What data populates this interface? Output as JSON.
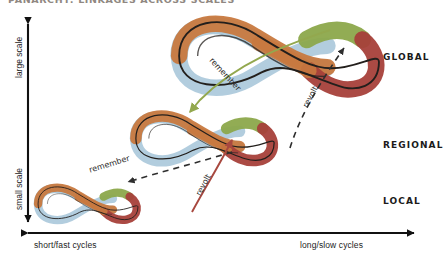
{
  "figure": {
    "title_partial": "PANARCHY: LINKAGES ACROSS SCALES",
    "axes": {
      "y_top_label": "large scale",
      "y_bottom_label": "small scale",
      "x_left_label": "short/fast cycles",
      "x_right_label": "long/slow cycles"
    },
    "scale_levels": [
      {
        "name": "global",
        "label": "GLOBAL"
      },
      {
        "name": "regional",
        "label": "REGIONAL"
      },
      {
        "name": "local",
        "label": "LOCAL"
      }
    ],
    "flows": [
      {
        "name": "remember-global-to-regional",
        "label": "remember",
        "color": "#93a84e",
        "style": "solid-curved-arrow"
      },
      {
        "name": "remember-regional-to-local",
        "label": "remember",
        "color": "#2e2e2e",
        "style": "dashed-arrow"
      },
      {
        "name": "revolt-local-to-regional",
        "label": "revolt",
        "color": "#a8483f",
        "style": "solid-curved-arrow"
      },
      {
        "name": "revolt-regional-to-global",
        "label": "revolt",
        "color": "#2e2e2e",
        "style": "dashed-arrow"
      }
    ],
    "adaptive_cycles": [
      {
        "name": "global-cycle",
        "level": "GLOBAL",
        "size": "large"
      },
      {
        "name": "regional-cycle",
        "level": "REGIONAL",
        "size": "medium"
      },
      {
        "name": "local-cycle",
        "level": "LOCAL",
        "size": "small"
      }
    ],
    "colors": {
      "orange": "#c8793f",
      "green": "#8ca84b",
      "blue": "#a9c6d8",
      "dark_red": "#a6403a",
      "ink": "#231f1c",
      "axis": "#111111",
      "background": "#ffffff"
    }
  }
}
